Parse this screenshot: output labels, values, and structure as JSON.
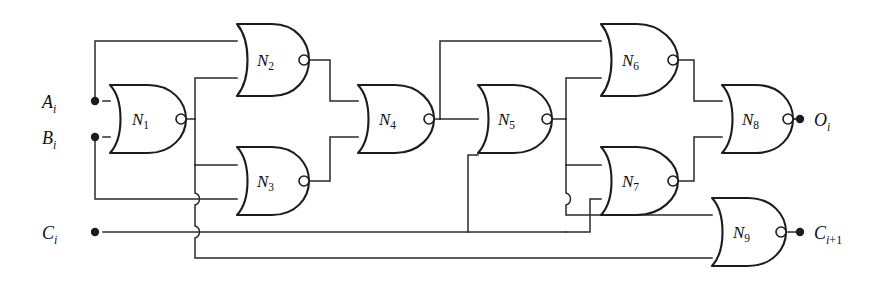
{
  "figure": {
    "type": "logic-circuit-schematic",
    "background_color": "#ffffff",
    "wire_color": "#2a2a2a",
    "gate_color": "#1c1c1c"
  },
  "inputs": [
    {
      "id": "A",
      "label": "A",
      "subscript": "i",
      "x": 95,
      "y": 101
    },
    {
      "id": "B",
      "label": "B",
      "subscript": "i",
      "x": 95,
      "y": 137
    },
    {
      "id": "C",
      "label": "C",
      "subscript": "i",
      "x": 95,
      "y": 232
    }
  ],
  "outputs": [
    {
      "id": "O",
      "label": "O",
      "subscript": "i",
      "x": 806,
      "y": 119
    },
    {
      "id": "Cout",
      "label": "C",
      "subscript": "i+1",
      "x": 806,
      "y": 232
    }
  ],
  "gates": [
    {
      "id": "N1",
      "label": "N",
      "subscript": "1",
      "x": 110,
      "y": 85,
      "w": 70,
      "h": 68,
      "inputs": [
        "A_i",
        "B_i"
      ],
      "output": "n1"
    },
    {
      "id": "N2",
      "label": "N",
      "subscript": "2",
      "x": 237,
      "y": 24,
      "w": 70,
      "h": 72,
      "inputs": [
        "A_i",
        "n1"
      ],
      "output": "n2"
    },
    {
      "id": "N3",
      "label": "N",
      "subscript": "3",
      "x": 237,
      "y": 147,
      "w": 70,
      "h": 68,
      "inputs": [
        "n1",
        "B_i"
      ],
      "output": "n3"
    },
    {
      "id": "N4",
      "label": "N",
      "subscript": "4",
      "x": 358,
      "y": 85,
      "w": 70,
      "h": 68,
      "inputs": [
        "n2",
        "n3"
      ],
      "output": "n4"
    },
    {
      "id": "N5",
      "label": "N",
      "subscript": "5",
      "x": 478,
      "y": 85,
      "w": 68,
      "h": 68,
      "inputs": [
        "n4",
        "C_i"
      ],
      "output": "n5"
    },
    {
      "id": "N6",
      "label": "N",
      "subscript": "6",
      "x": 601,
      "y": 24,
      "w": 70,
      "h": 72,
      "inputs": [
        "n4",
        "n5"
      ],
      "output": "n6"
    },
    {
      "id": "N7",
      "label": "N",
      "subscript": "7",
      "x": 601,
      "y": 147,
      "w": 70,
      "h": 68,
      "inputs": [
        "n5",
        "C_i"
      ],
      "output": "n7"
    },
    {
      "id": "N8",
      "label": "N",
      "subscript": "8",
      "x": 722,
      "y": 85,
      "w": 70,
      "h": 68,
      "inputs": [
        "n6",
        "n7"
      ],
      "output": "O_i"
    },
    {
      "id": "N9",
      "label": "N",
      "subscript": "9",
      "x": 712,
      "y": 198,
      "w": 70,
      "h": 68,
      "inputs": [
        "n5",
        "n1"
      ],
      "output": "C_i+1"
    }
  ],
  "wire_hops": [
    {
      "x": 195,
      "y": 199
    },
    {
      "x": 195,
      "y": 232
    },
    {
      "x": 566,
      "y": 199
    }
  ],
  "rails": {
    "top_y": 41,
    "ci_y": 232,
    "bottom_y": 258
  }
}
